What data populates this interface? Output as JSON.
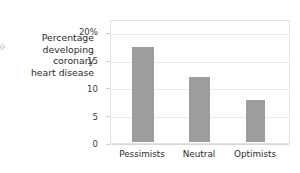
{
  "marker": {
    "glyph": "»",
    "color": "#d2d2d2"
  },
  "axis_title_lines": [
    "Percentage",
    "developing",
    "coronary",
    "heart disease"
  ],
  "colors": {
    "bar": "#9d9d9d",
    "gridline": "#ececec",
    "frame": "#e2e2e2",
    "text": "#2b2b2b"
  },
  "chart_data": {
    "type": "bar",
    "title": "",
    "xlabel": "",
    "ylabel": "Percentage developing coronary heart disease",
    "categories": [
      "Pessimists",
      "Neutral",
      "Optimists"
    ],
    "values": [
      17.3,
      11.8,
      7.7
    ],
    "ylim": [
      0,
      20
    ],
    "yticks": [
      0,
      5,
      10,
      15,
      20
    ],
    "ytick_labels": [
      "0",
      "5",
      "10",
      "15",
      "20%"
    ],
    "grid": true,
    "legend": "none",
    "units": "percent"
  }
}
